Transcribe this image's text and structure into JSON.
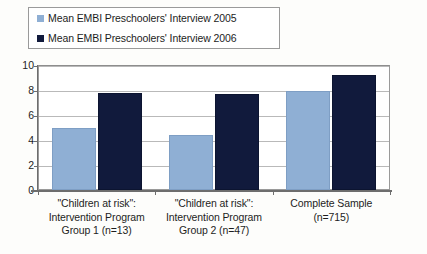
{
  "chart_data": {
    "type": "bar",
    "title": "",
    "xlabel": "",
    "ylabel": "",
    "ylim": [
      0,
      10
    ],
    "yticks": [
      "0",
      "2",
      "4",
      "6",
      "8",
      "10"
    ],
    "grid": true,
    "legend_position": "top-left",
    "categories": [
      {
        "lines": [
          "\"Children at risk\":",
          "Intervention Program",
          "Group 1 (n=13)"
        ]
      },
      {
        "lines": [
          "\"Children at risk\":",
          "Intervention Program",
          "Group 2 (n=47)"
        ]
      },
      {
        "lines": [
          "Complete Sample",
          "(n=715)"
        ]
      }
    ],
    "series": [
      {
        "name": "Mean EMBI Preschoolers' Interview 2005",
        "color": "#8fafd4",
        "values": [
          5.0,
          4.4,
          7.9
        ]
      },
      {
        "name": "Mean EMBI Preschoolers' Interview 2006",
        "color": "#111a3c",
        "values": [
          7.8,
          7.7,
          9.2
        ]
      }
    ]
  }
}
